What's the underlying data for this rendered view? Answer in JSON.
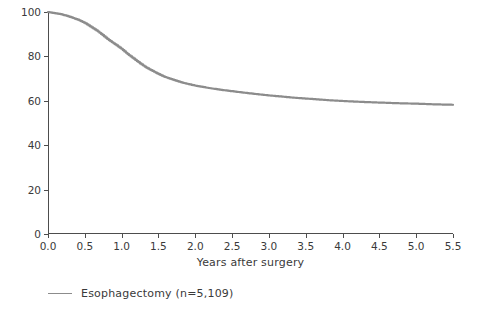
{
  "chart_data": {
    "type": "line",
    "title": "",
    "xlabel": "Years after surgery",
    "ylabel": "Survival rate (%)",
    "xlim": [
      0.0,
      5.5
    ],
    "ylim": [
      0,
      100
    ],
    "grid": false,
    "legend_position": "below-left",
    "x_ticks": [
      "0.0",
      "0.5",
      "1.0",
      "1.5",
      "2.0",
      "2.5",
      "3.0",
      "3.5",
      "4.0",
      "4.5",
      "5.0",
      "5.5"
    ],
    "y_ticks": [
      "0",
      "20",
      "40",
      "60",
      "80",
      "100"
    ],
    "series": [
      {
        "name": "Esophagectomy (n=5,109)",
        "color": "#8c8c8c",
        "x": [
          0.0,
          0.08,
          0.17,
          0.25,
          0.33,
          0.42,
          0.5,
          0.58,
          0.67,
          0.75,
          0.83,
          0.92,
          1.0,
          1.08,
          1.17,
          1.25,
          1.33,
          1.42,
          1.5,
          1.58,
          1.67,
          1.75,
          1.83,
          1.92,
          2.0,
          2.17,
          2.33,
          2.5,
          2.67,
          2.83,
          3.0,
          3.17,
          3.33,
          3.5,
          3.67,
          3.83,
          4.0,
          4.25,
          4.5,
          4.75,
          5.0,
          5.25,
          5.5
        ],
        "values": [
          100.0,
          99.5,
          99.0,
          98.3,
          97.4,
          96.3,
          95.0,
          93.3,
          91.4,
          89.3,
          87.2,
          85.2,
          83.3,
          81.0,
          78.8,
          76.8,
          75.0,
          73.4,
          72.0,
          70.8,
          69.8,
          68.9,
          68.1,
          67.4,
          66.8,
          65.8,
          65.0,
          64.3,
          63.6,
          63.0,
          62.4,
          61.9,
          61.4,
          61.0,
          60.6,
          60.2,
          59.9,
          59.5,
          59.2,
          58.9,
          58.7,
          58.4,
          58.2
        ]
      }
    ]
  },
  "legend": {
    "items": [
      {
        "label": "Esophagectomy (n=5,109)",
        "color": "#8c8c8c"
      }
    ]
  },
  "axes": {
    "x_title": "Years after surgery",
    "y_title": "Survival rate (%)"
  }
}
